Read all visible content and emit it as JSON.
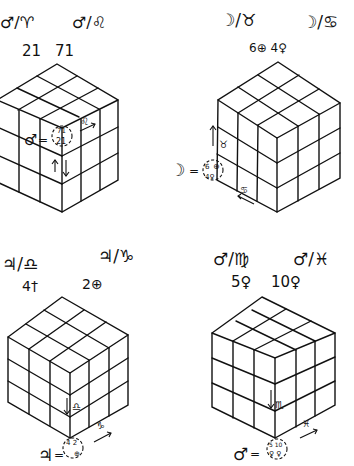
{
  "ink_color": "#111111",
  "background": "#ffffff",
  "panels": [
    {
      "id": "top-left",
      "planet": "♂",
      "planet_name": "Mars",
      "header": {
        "left": {
          "planet": "♂",
          "sign": "♈",
          "sign_name": "Aries",
          "value": "21"
        },
        "right": {
          "planet": "♂",
          "sign": "♌",
          "sign_name": "Leo",
          "value": "71"
        }
      },
      "equation": {
        "planet": "♂",
        "eq": "=",
        "top": "71",
        "bottom": "21"
      },
      "face_labels": [
        {
          "glyph": "♌",
          "arrow": "→"
        },
        {
          "glyph": "↑↓"
        }
      ]
    },
    {
      "id": "top-right",
      "planet": "☽",
      "planet_name": "Moon",
      "header": {
        "left": {
          "planet": "☽",
          "sign": "♉",
          "sign_name": "Taurus",
          "value": "6",
          "value_glyph": "⊕"
        },
        "right": {
          "planet": "☽",
          "sign": "♋",
          "sign_name": "Cancer",
          "value": "4",
          "value_glyph": "♀"
        }
      },
      "header_values": "6⊕ 4♀",
      "equation": {
        "planet": "☽",
        "eq": "=",
        "top": "6",
        "top_glyph": "⊕",
        "bottom": "4♀"
      },
      "face_labels": [
        {
          "glyph": "♉",
          "arrow": "↑"
        },
        {
          "glyph": "♋",
          "arrow": "←"
        }
      ]
    },
    {
      "id": "bottom-left",
      "planet": "♃",
      "planet_name": "Jupiter",
      "header": {
        "left": {
          "planet": "♃",
          "sign": "♎",
          "sign_name": "Libra",
          "value": "4",
          "value_glyph": "†"
        },
        "right": {
          "planet": "♃",
          "sign": "♑",
          "sign_name": "Capricorn",
          "value": "2",
          "value_glyph": "⊕"
        }
      },
      "equation": {
        "planet": "♃",
        "eq": "=",
        "top": "4 2",
        "bottom": "⊕"
      },
      "face_labels": [
        {
          "glyph": "♎",
          "arrow": "↓"
        },
        {
          "glyph": "♑",
          "arrow": "→"
        }
      ]
    },
    {
      "id": "bottom-right",
      "planet": "♂",
      "planet_name": "Mars",
      "header": {
        "left": {
          "planet": "♂",
          "sign": "♍",
          "sign_name": "Virgo",
          "value": "5",
          "value_glyph": "♀"
        },
        "right": {
          "planet": "♂",
          "sign": "♓",
          "sign_name": "Pisces",
          "value": "10",
          "value_glyph": "♀"
        }
      },
      "equation": {
        "planet": "♂",
        "eq": "=",
        "top": "5 10",
        "bottom": "♀ ♀"
      },
      "face_labels": [
        {
          "glyph": "♏",
          "arrow": "↓"
        },
        {
          "glyph": "♓",
          "arrow": "→"
        }
      ]
    }
  ]
}
